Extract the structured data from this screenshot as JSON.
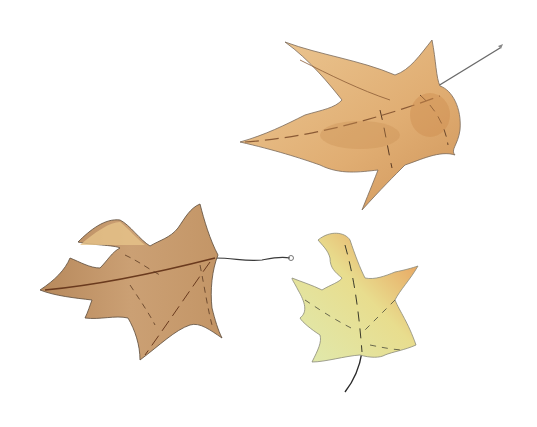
{
  "scene": {
    "title": "Watercolor illustration of three autumn leaves",
    "background": "#ffffff",
    "leaves": [
      {
        "name": "Large maple leaf (top right)",
        "fill": "#e2b277",
        "shade": "#c98f52",
        "vein": "#5a3a22"
      },
      {
        "name": "Oak leaf (bottom left)",
        "fill": "#c99e6e",
        "shade": "#a8784a",
        "vein": "#5a3a22"
      },
      {
        "name": "Small maple leaf (bottom right)",
        "fill": "#dde8a4",
        "shade": "#e79a5a",
        "vein": "#3a2a1a"
      }
    ]
  }
}
